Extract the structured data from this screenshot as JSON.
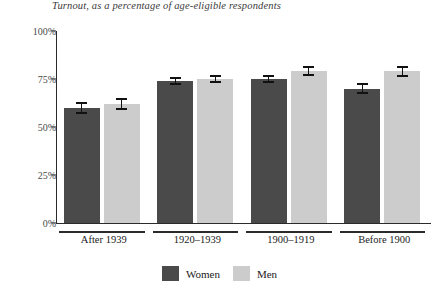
{
  "chart_data": {
    "type": "bar",
    "title": "Turnout, as a percentage of age-eligible respondents",
    "xlabel": "",
    "ylabel": "",
    "ylim": [
      0,
      100
    ],
    "yticks": [
      "0%",
      "25%",
      "50%",
      "75%",
      "100%"
    ],
    "ytick_values": [
      0,
      25,
      50,
      75,
      100
    ],
    "grid": false,
    "legend_position": "bottom-center",
    "categories": [
      "After 1939",
      "1920–1939",
      "1900–1919",
      "Before 1900"
    ],
    "series": [
      {
        "name": "Women",
        "color": "#4a4a4a",
        "values": [
          60,
          74,
          75,
          70
        ],
        "errors": [
          2.5,
          1.5,
          1.5,
          2.5
        ]
      },
      {
        "name": "Men",
        "color": "#cccccc",
        "values": [
          62,
          75,
          79,
          79
        ],
        "errors": [
          2.5,
          1.5,
          2,
          2.5
        ]
      }
    ]
  },
  "legend": {
    "items": [
      {
        "label": "Women",
        "swatch": "women-swatch"
      },
      {
        "label": "Men",
        "swatch": "men-swatch"
      }
    ]
  }
}
